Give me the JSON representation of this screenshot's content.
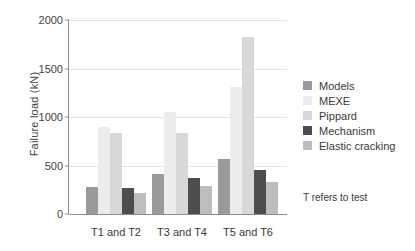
{
  "chart_data": {
    "type": "bar",
    "title": "",
    "xlabel": "",
    "ylabel": "Failure load (kN)",
    "ylim": [
      0,
      2000
    ],
    "yticks": [
      0,
      500,
      1000,
      1500,
      2000
    ],
    "ytick_labels": [
      "0",
      "500",
      "1000",
      "1500",
      "2000"
    ],
    "grid": true,
    "legend_position": "right",
    "categories": [
      "T1 and T2",
      "T3 and T4",
      "T5 and T6"
    ],
    "series": [
      {
        "name": "Models",
        "color": "#9a9a9a",
        "values": [
          275,
          415,
          570
        ]
      },
      {
        "name": "MEXE",
        "color": "#ececec",
        "values": [
          900,
          1050,
          1310
        ]
      },
      {
        "name": "Pippard",
        "color": "#d8d8d8",
        "values": [
          835,
          835,
          1820
        ]
      },
      {
        "name": "Mechanism",
        "color": "#4d4d4d",
        "values": [
          270,
          370,
          455
        ]
      },
      {
        "name": "Elastic cracking",
        "color": "#bdbdbd",
        "values": [
          215,
          290,
          335
        ]
      }
    ],
    "annotations": [
      {
        "text": "T refers to test"
      }
    ]
  },
  "note": "T refers to test"
}
